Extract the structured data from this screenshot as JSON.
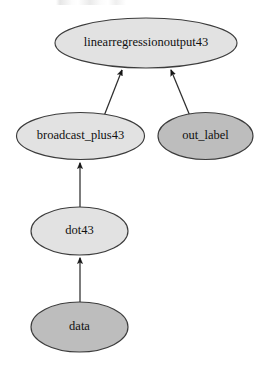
{
  "graph": {
    "title": "linearregressionoutput43",
    "direction": "bottom-to-top",
    "background": "#ffffff",
    "palette": {
      "fill_light": "#e2e2e2",
      "fill_dark": "#bdbdbd",
      "stroke": "#3c3c3c",
      "text": "#101010",
      "edge": "#2e2e2e"
    },
    "nodes": [
      {
        "id": "linearregressionoutput43",
        "label": "linearregressionoutput43",
        "cx": 146,
        "cy": 43,
        "rx": 91,
        "ry": 25,
        "fill": "#e2e2e2",
        "font_size": 12.5
      },
      {
        "id": "broadcast_plus43",
        "label": "broadcast_plus43",
        "cx": 80.5,
        "cy": 136,
        "rx": 64,
        "ry": 23.5,
        "fill": "#e2e2e2",
        "font_size": 12.5
      },
      {
        "id": "out_label",
        "label": "out_label",
        "cx": 205.5,
        "cy": 136,
        "rx": 47.5,
        "ry": 23.5,
        "fill": "#bdbdbd",
        "font_size": 12.5
      },
      {
        "id": "dot43",
        "label": "dot43",
        "cx": 79.5,
        "cy": 231,
        "rx": 48.5,
        "ry": 24,
        "fill": "#e2e2e2",
        "font_size": 12.5
      },
      {
        "id": "data",
        "label": "data",
        "cx": 79.5,
        "cy": 327,
        "rx": 48.5,
        "ry": 25,
        "fill": "#bdbdbd",
        "font_size": 12.5
      }
    ],
    "edges": [
      {
        "id": "edge-broadcast-to-output",
        "from": "broadcast_plus43",
        "to": "linearregressionoutput43",
        "x1": 104,
        "y1": 116,
        "x2": 122,
        "y2": 70
      },
      {
        "id": "edge-outlabel-to-output",
        "from": "out_label",
        "to": "linearregressionoutput43",
        "x1": 190,
        "y1": 116,
        "x2": 171,
        "y2": 70
      },
      {
        "id": "edge-dot-to-broadcast",
        "from": "dot43",
        "to": "broadcast_plus43",
        "x1": 80,
        "y1": 207,
        "x2": 80,
        "y2": 163
      },
      {
        "id": "edge-data-to-dot",
        "from": "data",
        "to": "dot43",
        "x1": 80,
        "y1": 302,
        "x2": 80,
        "y2": 258
      }
    ]
  }
}
